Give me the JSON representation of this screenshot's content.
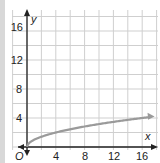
{
  "chart_data": {
    "type": "line",
    "title": "",
    "xlabel": "x",
    "ylabel": "y",
    "origin_label": "O",
    "xlim": [
      0,
      17
    ],
    "ylim": [
      0,
      17
    ],
    "x_ticks": [
      "4",
      "8",
      "12",
      "16"
    ],
    "y_ticks": [
      "4",
      "8",
      "12",
      "16"
    ],
    "grid": true,
    "grid_step": 2,
    "series": [
      {
        "name": "y = √x",
        "x": [
          0,
          1,
          2,
          4,
          6,
          8,
          10,
          12,
          14,
          16,
          17
        ],
        "values": [
          0,
          1,
          1.41,
          2,
          2.45,
          2.83,
          3.16,
          3.46,
          3.74,
          4,
          4.12
        ],
        "color": "#9a9a9a",
        "end_arrow": true
      }
    ],
    "colors": {
      "axis": "#222222",
      "grid": "#cfcfcf",
      "curve": "#9a9a9a"
    }
  }
}
